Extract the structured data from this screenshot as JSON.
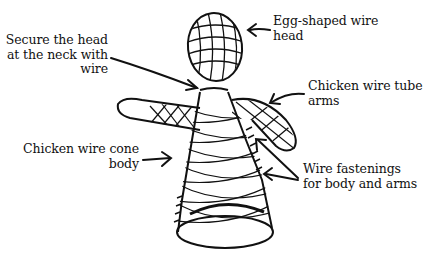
{
  "diagram": {
    "labels": {
      "neck": {
        "lines": [
          "Secure the head",
          "at the neck with",
          "wire"
        ]
      },
      "head": {
        "lines": [
          "Egg-shaped wire",
          "head"
        ]
      },
      "arms": {
        "lines": [
          "Chicken wire tube",
          "arms"
        ]
      },
      "body": {
        "lines": [
          "Chicken wire cone",
          "body"
        ]
      },
      "fastenings": {
        "lines": [
          "Wire fastenings",
          "for body and arms"
        ]
      }
    },
    "colors": {
      "ink": "#111111",
      "background": "#ffffff"
    }
  }
}
